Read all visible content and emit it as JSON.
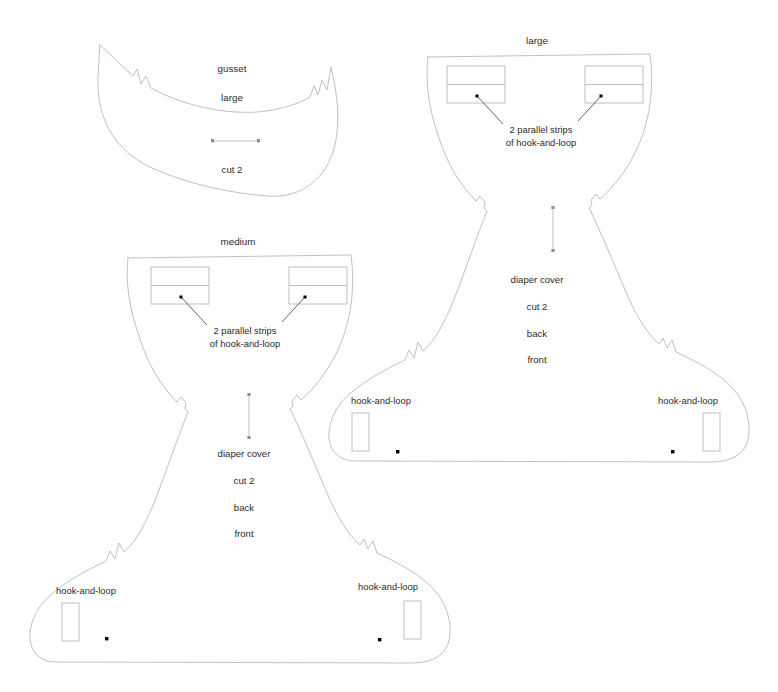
{
  "document": {
    "kind": "sewing-pattern-sheet",
    "subject": "diaper cover",
    "background_color": "#ffffff",
    "outline_color": "#b9b9bd",
    "text_color": "#2b2b2b",
    "marker_color": "#000000"
  },
  "pieces": [
    {
      "id": "gusset-large",
      "name": "gusset large",
      "title_lines": [
        "gusset",
        "large"
      ],
      "title_line_1": "gusset",
      "title_line_2": "large",
      "cut_instruction": "cut 2",
      "grainline": "horizontal",
      "notch_count": 2
    },
    {
      "id": "diaper-cover-large",
      "name": "diaper cover large",
      "size_label": "large",
      "center_labels": [
        "diaper cover",
        "cut 2",
        "back",
        "front"
      ],
      "label_diaper_cover": "diaper cover",
      "label_cut": "cut 2",
      "label_back": "back",
      "label_front": "front",
      "grainline": "vertical",
      "callout": {
        "line_1": "2 parallel strips",
        "line_2": "of hook-and-loop",
        "target_count": 2
      },
      "tab_labels": {
        "left": "hook-and-loop",
        "right": "hook-and-loop"
      },
      "waist_strip_boxes": 2,
      "strips_per_box": 2
    },
    {
      "id": "diaper-cover-medium",
      "name": "diaper cover medium",
      "size_label": "medium",
      "center_labels": [
        "diaper cover",
        "cut 2",
        "back",
        "front"
      ],
      "label_diaper_cover": "diaper cover",
      "label_cut": "cut 2",
      "label_back": "back",
      "label_front": "front",
      "grainline": "vertical",
      "callout": {
        "line_1": "2 parallel strips",
        "line_2": "of hook-and-loop",
        "target_count": 2
      },
      "tab_labels": {
        "left": "hook-and-loop",
        "right": "hook-and-loop"
      },
      "waist_strip_boxes": 2,
      "strips_per_box": 2
    }
  ]
}
